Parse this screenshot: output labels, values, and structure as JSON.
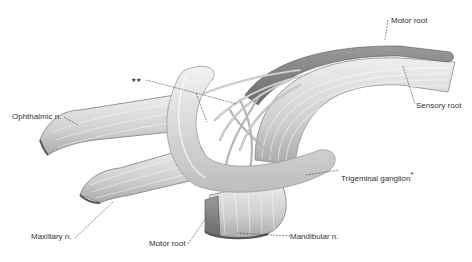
{
  "figure": {
    "labels": {
      "motor_root_top": "Motor root",
      "sensory_root": "Sensory root",
      "double_star": "★★",
      "ophthalmic": "Ophthalmic n.",
      "trigeminal_ganglion": "Trigeminal ganglion",
      "ganglion_star": "*",
      "maxillary": "Maxillary n.",
      "motor_root_bottom": "Motor root",
      "mandibular": "Mandibular n."
    },
    "colors": {
      "background": "#ffffff",
      "nerve_light": "#e4e4e4",
      "nerve_mid": "#c4c4c4",
      "nerve_dark": "#8a8a8a",
      "motor_root": "#7a7a7a",
      "label_text": "#333333",
      "leader_line": "#444444"
    }
  }
}
